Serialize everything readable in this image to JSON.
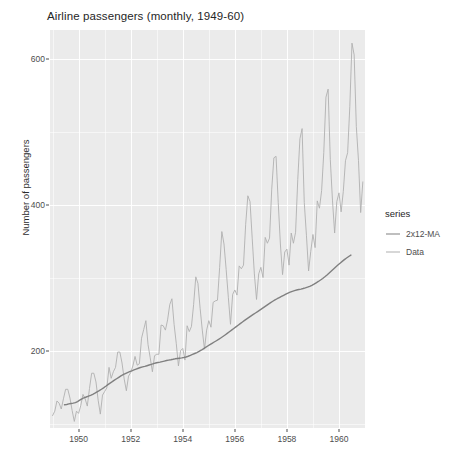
{
  "chart_data": {
    "type": "line",
    "title": "Airline passengers (monthly, 1949-60)",
    "xlabel": "",
    "ylabel": "Number of passengers",
    "xlim": [
      1948.9,
      1961.0
    ],
    "ylim": [
      95,
      640
    ],
    "grid": true,
    "legend_position": "right",
    "legend_title": "series",
    "x_ticks": [
      1950,
      1952,
      1954,
      1956,
      1958,
      1960
    ],
    "x_tick_labels": [
      "1950",
      "1952",
      "1954",
      "1956",
      "1958",
      "1960"
    ],
    "y_ticks": [
      200,
      400,
      600
    ],
    "y_tick_labels": [
      "200",
      "400",
      "600"
    ],
    "x_minor_ticks": [
      1949,
      1951,
      1953,
      1955,
      1957,
      1959,
      1961
    ],
    "y_minor_ticks": [
      100,
      300,
      500
    ],
    "colors": {
      "panel_background": "#ebebeb",
      "grid": "#ffffff",
      "series_ma": "#808080",
      "series_data": "#b0b0b0",
      "text": "#4d4d4d",
      "title_text": "#262626"
    },
    "series": [
      {
        "name": "2x12-MA",
        "color": "#808080",
        "width": 1.4,
        "x": [
          1949.4583,
          1949.5417,
          1949.625,
          1949.7083,
          1949.7917,
          1949.875,
          1949.9583,
          1950.0417,
          1950.125,
          1950.2083,
          1950.2917,
          1950.375,
          1950.4583,
          1950.5417,
          1950.625,
          1950.7083,
          1950.7917,
          1950.875,
          1950.9583,
          1951.0417,
          1951.125,
          1951.2083,
          1951.2917,
          1951.375,
          1951.4583,
          1951.5417,
          1951.625,
          1951.7083,
          1951.7917,
          1951.875,
          1951.9583,
          1952.0417,
          1952.125,
          1952.2083,
          1952.2917,
          1952.375,
          1952.4583,
          1952.5417,
          1952.625,
          1952.7083,
          1952.7917,
          1952.875,
          1952.9583,
          1953.0417,
          1953.125,
          1953.2083,
          1953.2917,
          1953.375,
          1953.4583,
          1953.5417,
          1953.625,
          1953.7083,
          1953.7917,
          1953.875,
          1953.9583,
          1954.0417,
          1954.125,
          1954.2083,
          1954.2917,
          1954.375,
          1954.4583,
          1954.5417,
          1954.625,
          1954.7083,
          1954.7917,
          1954.875,
          1954.9583,
          1955.0417,
          1955.125,
          1955.2083,
          1955.2917,
          1955.375,
          1955.4583,
          1955.5417,
          1955.625,
          1955.7083,
          1955.7917,
          1955.875,
          1955.9583,
          1956.0417,
          1956.125,
          1956.2083,
          1956.2917,
          1956.375,
          1956.4583,
          1956.5417,
          1956.625,
          1956.7083,
          1956.7917,
          1956.875,
          1956.9583,
          1957.0417,
          1957.125,
          1957.2083,
          1957.2917,
          1957.375,
          1957.4583,
          1957.5417,
          1957.625,
          1957.7083,
          1957.7917,
          1957.875,
          1957.9583,
          1958.0417,
          1958.125,
          1958.2083,
          1958.2917,
          1958.375,
          1958.4583,
          1958.5417,
          1958.625,
          1958.7083,
          1958.7917,
          1958.875,
          1958.9583,
          1959.0417,
          1959.125,
          1959.2083,
          1959.2917,
          1959.375,
          1959.4583,
          1959.5417,
          1959.625,
          1959.7083,
          1959.7917,
          1959.875,
          1959.9583,
          1960.0417,
          1960.125,
          1960.2083,
          1960.2917,
          1960.375,
          1960.4583
        ],
        "y": [
          126.79,
          127.25,
          127.96,
          128.58,
          129.0,
          129.75,
          131.25,
          133.08,
          134.92,
          136.42,
          137.42,
          138.54,
          139.79,
          141.13,
          142.67,
          144.5,
          146.17,
          148.04,
          150.0,
          152.12,
          154.42,
          156.5,
          158.42,
          160.46,
          162.42,
          164.42,
          166.46,
          168.08,
          169.5,
          170.88,
          172.08,
          173.25,
          174.5,
          175.71,
          176.83,
          177.79,
          178.67,
          179.42,
          180.29,
          181.21,
          182.17,
          183.12,
          183.96,
          184.67,
          185.25,
          185.92,
          186.67,
          187.38,
          188.0,
          188.5,
          189.08,
          189.75,
          190.17,
          190.58,
          191.0,
          191.5,
          192.25,
          193.25,
          194.5,
          195.83,
          197.04,
          198.33,
          199.83,
          201.5,
          203.42,
          205.42,
          207.33,
          209.17,
          211.0,
          212.75,
          214.5,
          216.33,
          218.25,
          220.25,
          222.33,
          224.5,
          226.75,
          229.0,
          231.25,
          233.5,
          235.75,
          238.0,
          240.21,
          242.33,
          244.42,
          246.5,
          248.58,
          250.58,
          252.5,
          254.42,
          256.38,
          258.38,
          260.46,
          262.58,
          264.71,
          266.71,
          268.58,
          270.33,
          272.0,
          273.58,
          275.17,
          276.75,
          278.25,
          279.67,
          281.0,
          282.17,
          283.12,
          283.92,
          284.58,
          285.25,
          286.0,
          286.88,
          287.88,
          289.0,
          290.38,
          292.0,
          293.79,
          295.67,
          297.67,
          299.79,
          302.08,
          304.58,
          307.21,
          309.96,
          312.75,
          315.5,
          318.17,
          320.71,
          323.17,
          325.5,
          327.75,
          329.88,
          331.83
        ]
      },
      {
        "name": "Data",
        "color": "#b0b0b0",
        "width": 0.9,
        "x": [
          1949.0,
          1949.0833,
          1949.1667,
          1949.25,
          1949.3333,
          1949.4167,
          1949.5,
          1949.5833,
          1949.6667,
          1949.75,
          1949.8333,
          1949.9167,
          1950.0,
          1950.0833,
          1950.1667,
          1950.25,
          1950.3333,
          1950.4167,
          1950.5,
          1950.5833,
          1950.6667,
          1950.75,
          1950.8333,
          1950.9167,
          1951.0,
          1951.0833,
          1951.1667,
          1951.25,
          1951.3333,
          1951.4167,
          1951.5,
          1951.5833,
          1951.6667,
          1951.75,
          1951.8333,
          1951.9167,
          1952.0,
          1952.0833,
          1952.1667,
          1952.25,
          1952.3333,
          1952.4167,
          1952.5,
          1952.5833,
          1952.6667,
          1952.75,
          1952.8333,
          1952.9167,
          1953.0,
          1953.0833,
          1953.1667,
          1953.25,
          1953.3333,
          1953.4167,
          1953.5,
          1953.5833,
          1953.6667,
          1953.75,
          1953.8333,
          1953.9167,
          1954.0,
          1954.0833,
          1954.1667,
          1954.25,
          1954.3333,
          1954.4167,
          1954.5,
          1954.5833,
          1954.6667,
          1954.75,
          1954.8333,
          1954.9167,
          1955.0,
          1955.0833,
          1955.1667,
          1955.25,
          1955.3333,
          1955.4167,
          1955.5,
          1955.5833,
          1955.6667,
          1955.75,
          1955.8333,
          1955.9167,
          1956.0,
          1956.0833,
          1956.1667,
          1956.25,
          1956.3333,
          1956.4167,
          1956.5,
          1956.5833,
          1956.6667,
          1956.75,
          1956.8333,
          1956.9167,
          1957.0,
          1957.0833,
          1957.1667,
          1957.25,
          1957.3333,
          1957.4167,
          1957.5,
          1957.5833,
          1957.6667,
          1957.75,
          1957.8333,
          1957.9167,
          1958.0,
          1958.0833,
          1958.1667,
          1958.25,
          1958.3333,
          1958.4167,
          1958.5,
          1958.5833,
          1958.6667,
          1958.75,
          1958.8333,
          1958.9167,
          1959.0,
          1959.0833,
          1959.1667,
          1959.25,
          1959.3333,
          1959.4167,
          1959.5,
          1959.5833,
          1959.6667,
          1959.75,
          1959.8333,
          1959.9167,
          1960.0,
          1960.0833,
          1960.1667,
          1960.25,
          1960.3333,
          1960.4167,
          1960.5,
          1960.5833,
          1960.6667,
          1960.75,
          1960.8333,
          1960.9167
        ],
        "y": [
          112,
          118,
          132,
          129,
          121,
          135,
          148,
          148,
          136,
          119,
          104,
          118,
          115,
          126,
          141,
          135,
          125,
          149,
          170,
          170,
          158,
          133,
          114,
          140,
          145,
          150,
          178,
          163,
          172,
          178,
          199,
          199,
          184,
          162,
          146,
          166,
          171,
          180,
          193,
          181,
          183,
          218,
          230,
          242,
          209,
          191,
          172,
          194,
          196,
          196,
          236,
          235,
          229,
          243,
          264,
          272,
          237,
          211,
          180,
          201,
          204,
          188,
          235,
          227,
          234,
          264,
          302,
          293,
          259,
          229,
          203,
          229,
          242,
          233,
          267,
          269,
          270,
          315,
          364,
          347,
          312,
          274,
          237,
          278,
          284,
          277,
          317,
          313,
          318,
          374,
          413,
          405,
          355,
          306,
          271,
          306,
          315,
          301,
          356,
          348,
          355,
          422,
          465,
          467,
          404,
          347,
          305,
          336,
          340,
          318,
          362,
          348,
          363,
          435,
          491,
          505,
          404,
          359,
          310,
          337,
          360,
          342,
          406,
          396,
          420,
          472,
          548,
          559,
          463,
          407,
          362,
          405,
          417,
          391,
          419,
          461,
          472,
          535,
          622,
          606,
          508,
          461,
          390,
          432
        ]
      }
    ]
  }
}
